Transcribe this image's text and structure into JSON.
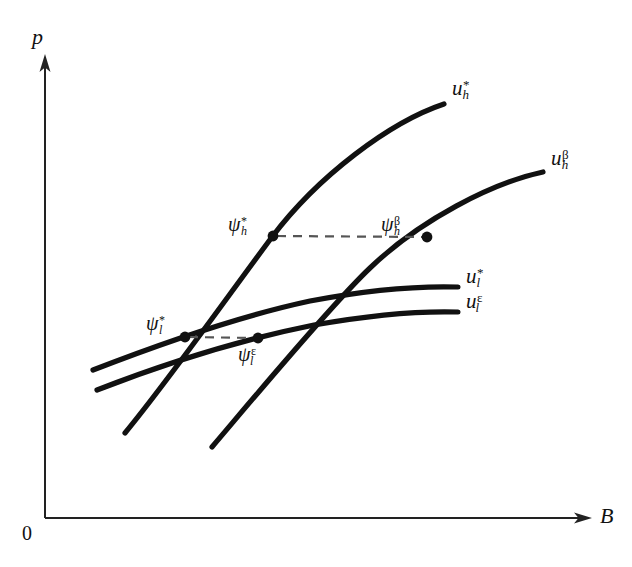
{
  "figure": {
    "type": "economics-indifference-curve-diagram",
    "background_color": "#ffffff",
    "line_color": "#111111",
    "dashed_color": "#555555"
  },
  "axes": {
    "y_label": "p",
    "x_label": "B",
    "origin_label": "0",
    "y_axis": {
      "x": 45,
      "top": 58,
      "bottom": 518,
      "arrow": "up"
    },
    "x_axis": {
      "y": 518,
      "left": 45,
      "right": 592,
      "arrow": "right"
    }
  },
  "curves": [
    {
      "name": "u-star-h",
      "label_base": "u",
      "label_sup": "*",
      "label_sub": "h",
      "label_x": 452,
      "label_y": 78,
      "description": "steep upward concave curve through psi-star-l and psi-star-h"
    },
    {
      "name": "u-beta-h",
      "label_base": "u",
      "label_sup": "β",
      "label_sub": "h",
      "label_x": 551,
      "label_y": 148,
      "description": "steep upward concave curve through psi-eps-l and psi-beta-h"
    },
    {
      "name": "u-star-l",
      "label_base": "u",
      "label_sup": "*",
      "label_sub": "l",
      "label_x": 466,
      "label_y": 266,
      "description": "flat upper low-type curve"
    },
    {
      "name": "u-eps-l",
      "label_base": "u",
      "label_sup": "ε",
      "label_sub": "l",
      "label_x": 466,
      "label_y": 291,
      "description": "flat lower low-type curve"
    }
  ],
  "points": [
    {
      "name": "psi-star-h",
      "label_base": "ψ",
      "label_sup": "*",
      "label_sub": "h",
      "x": 273,
      "y": 236,
      "label_x": 228,
      "label_y": 214
    },
    {
      "name": "psi-beta-h",
      "label_base": "ψ",
      "label_sup": "β",
      "label_sub": "h",
      "x": 427,
      "y": 237,
      "label_x": 381,
      "label_y": 214
    },
    {
      "name": "psi-star-l",
      "label_base": "ψ",
      "label_sup": "*",
      "label_sub": "l",
      "x": 185,
      "y": 337,
      "label_x": 146,
      "label_y": 313
    },
    {
      "name": "psi-eps-l",
      "label_base": "ψ",
      "label_sup": "ε",
      "label_sub": "l",
      "x": 258,
      "y": 338,
      "label_x": 238,
      "label_y": 344
    }
  ],
  "connectors": [
    {
      "name": "dashed-high",
      "x1": 277,
      "y1": 236,
      "x2": 423,
      "y2": 237
    },
    {
      "name": "dashed-low",
      "x1": 189,
      "y1": 337,
      "x2": 254,
      "y2": 338
    }
  ]
}
